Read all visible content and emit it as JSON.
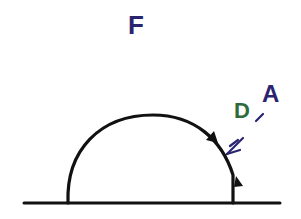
{
  "diagram": {
    "labels": {
      "top": "F",
      "green": "D",
      "right": "A"
    },
    "colors": {
      "line": "#111111",
      "navy": "#2a2470",
      "green": "#2f6b3a",
      "background": "#ffffff"
    },
    "shapes": {
      "baseline": "horizontal ground line",
      "dome": "semicircular arc",
      "markers": [
        "triangle",
        "triangle"
      ],
      "arrow": "arrow pointing at arc"
    }
  }
}
